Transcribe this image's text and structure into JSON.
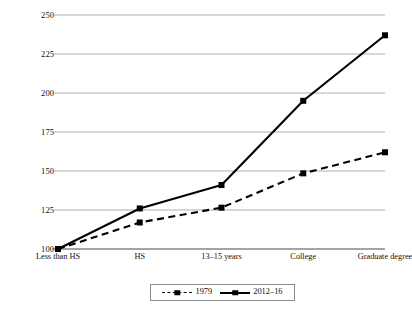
{
  "chart_data": {
    "type": "line",
    "title": "",
    "subtitle": "",
    "xlabel": "",
    "ylabel": "Earnings (Less than HS = 100)",
    "categories": [
      "Less than HS",
      "HS",
      "13–15 years",
      "College",
      "Graduate degree"
    ],
    "series": [
      {
        "name": "1979",
        "style": "dashed",
        "marker": "square",
        "color": "#000000",
        "values": [
          100,
          117,
          126.5,
          148.5,
          162
        ]
      },
      {
        "name": "2012–16",
        "style": "solid",
        "marker": "square",
        "color": "#000000",
        "values": [
          100,
          126,
          141,
          195,
          237
        ]
      }
    ],
    "ylim": [
      100,
      250
    ],
    "yticks": [
      100,
      125,
      150,
      175,
      200,
      225,
      250
    ],
    "ytick_labels": [
      "100",
      "125",
      "150",
      "175",
      "200",
      "225",
      "250"
    ],
    "grid": true,
    "grid_axis": "y",
    "grid_color": "#9a9a9a",
    "legend_position": "bottom",
    "legend_entries": [
      "1979",
      "2012–16"
    ]
  },
  "legend": {
    "entries": [
      {
        "label": "1979",
        "style": "dashed"
      },
      {
        "label": "2012–16",
        "style": "solid"
      }
    ]
  }
}
